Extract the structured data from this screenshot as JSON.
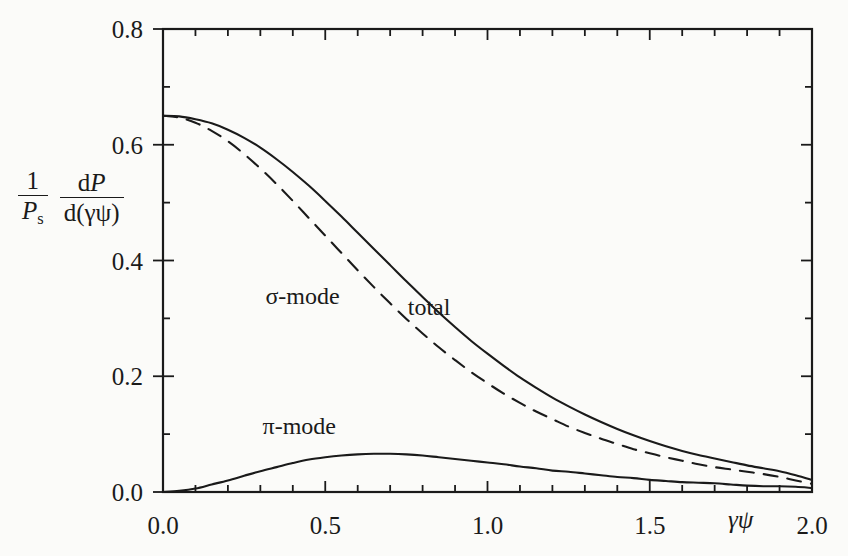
{
  "figure": {
    "background_color": "#fbfbf9",
    "ink_color": "#1a1a1a",
    "ylabel": {
      "left_numerator": "1",
      "left_denominator_p": "P",
      "left_denominator_sub": "s",
      "right_numerator_d": "d",
      "right_numerator_p": "P",
      "right_denominator": "d(γψ)"
    },
    "xlabel": "γψ"
  },
  "chart_data": {
    "type": "line",
    "title": "",
    "xlabel": "γψ",
    "ylabel": "(1/P_s) dP/d(γψ)",
    "xlim": [
      0.0,
      2.0
    ],
    "ylim": [
      0.0,
      0.8
    ],
    "xticks": [
      0.0,
      0.5,
      1.0,
      1.5,
      2.0
    ],
    "xtick_labels": [
      "0.0",
      "0.5",
      "1.0",
      "1.5",
      "2.0"
    ],
    "xminor_step": 0.1,
    "yticks": [
      0.0,
      0.2,
      0.4,
      0.6,
      0.8
    ],
    "ytick_labels": [
      "0.0",
      "0.2",
      "0.4",
      "0.6",
      "0.8"
    ],
    "yminor_step": 0.1,
    "grid": false,
    "legend_position": "inline-annotations",
    "annotations": [
      {
        "text": "σ-mode",
        "x": 0.43,
        "y": 0.325
      },
      {
        "text": "total",
        "x": 0.82,
        "y": 0.305
      },
      {
        "text": "π-mode",
        "x": 0.42,
        "y": 0.1
      }
    ],
    "x": [
      0.0,
      0.05,
      0.1,
      0.15,
      0.2,
      0.25,
      0.3,
      0.35,
      0.4,
      0.45,
      0.5,
      0.55,
      0.6,
      0.65,
      0.7,
      0.75,
      0.8,
      0.85,
      0.9,
      0.95,
      1.0,
      1.05,
      1.1,
      1.15,
      1.2,
      1.25,
      1.3,
      1.35,
      1.4,
      1.45,
      1.5,
      1.55,
      1.6,
      1.65,
      1.7,
      1.75,
      1.8,
      1.85,
      1.9,
      1.95,
      2.0
    ],
    "series": [
      {
        "name": "total",
        "style": "solid",
        "values": [
          0.65,
          0.649,
          0.644,
          0.637,
          0.626,
          0.612,
          0.595,
          0.575,
          0.553,
          0.529,
          0.503,
          0.476,
          0.448,
          0.42,
          0.392,
          0.364,
          0.337,
          0.31,
          0.285,
          0.261,
          0.239,
          0.218,
          0.198,
          0.18,
          0.163,
          0.148,
          0.134,
          0.121,
          0.109,
          0.098,
          0.088,
          0.079,
          0.071,
          0.064,
          0.058,
          0.052,
          0.046,
          0.041,
          0.036,
          0.029,
          0.021
        ]
      },
      {
        "name": "σ-mode",
        "style": "dashed",
        "values": [
          0.65,
          0.647,
          0.638,
          0.624,
          0.606,
          0.584,
          0.559,
          0.532,
          0.503,
          0.473,
          0.443,
          0.413,
          0.383,
          0.354,
          0.326,
          0.299,
          0.274,
          0.25,
          0.228,
          0.207,
          0.188,
          0.17,
          0.154,
          0.139,
          0.126,
          0.113,
          0.102,
          0.092,
          0.083,
          0.074,
          0.067,
          0.06,
          0.054,
          0.048,
          0.043,
          0.039,
          0.035,
          0.031,
          0.026,
          0.02,
          0.014
        ]
      },
      {
        "name": "π-mode",
        "style": "solid",
        "values": [
          0.0,
          0.002,
          0.006,
          0.013,
          0.02,
          0.028,
          0.036,
          0.043,
          0.05,
          0.056,
          0.06,
          0.063,
          0.065,
          0.066,
          0.066,
          0.065,
          0.063,
          0.06,
          0.057,
          0.054,
          0.051,
          0.048,
          0.044,
          0.041,
          0.037,
          0.035,
          0.032,
          0.029,
          0.026,
          0.024,
          0.021,
          0.019,
          0.017,
          0.016,
          0.015,
          0.013,
          0.011,
          0.01,
          0.01,
          0.009,
          0.007
        ]
      }
    ]
  }
}
